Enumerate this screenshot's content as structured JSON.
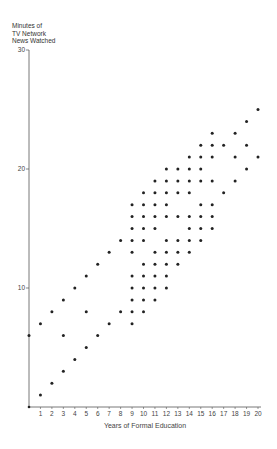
{
  "chart_data": {
    "type": "scatter",
    "title": "",
    "xlabel": "Years of Formal Education",
    "ylabel": "Minutes of TV Network News Watched",
    "ylabel_lines": [
      "Minutes of",
      "TV Network",
      "News Watched"
    ],
    "xlim": [
      0,
      20
    ],
    "ylim": [
      0,
      30
    ],
    "x_ticks": [
      1,
      2,
      3,
      4,
      5,
      6,
      7,
      8,
      9,
      10,
      11,
      12,
      13,
      14,
      15,
      16,
      17,
      18,
      19,
      20
    ],
    "y_ticks": [
      10,
      20,
      30
    ],
    "y_tick_labels": [
      "10",
      "20",
      "30"
    ],
    "grid": false,
    "legend": null,
    "points_by_x": {
      "0": [
        6
      ],
      "1": [
        7,
        1
      ],
      "2": [
        8,
        2
      ],
      "3": [
        9,
        6,
        3
      ],
      "4": [
        10,
        4
      ],
      "5": [
        11,
        8,
        5
      ],
      "6": [
        12,
        6
      ],
      "7": [
        13,
        7
      ],
      "8": [
        14,
        8
      ],
      "9": [
        17,
        16,
        15,
        14,
        13,
        11,
        10,
        9,
        8,
        7
      ],
      "10": [
        18,
        17,
        16,
        15,
        14,
        12,
        11,
        10,
        9,
        8
      ],
      "11": [
        19,
        18,
        17,
        16,
        15,
        13,
        12,
        11,
        10,
        9
      ],
      "12": [
        20,
        19,
        18,
        17,
        16,
        14,
        13,
        12,
        11,
        10
      ],
      "13": [
        20,
        19,
        18,
        16,
        14,
        13,
        12
      ],
      "14": [
        21,
        20,
        19,
        18,
        16,
        15,
        14,
        13
      ],
      "15": [
        22,
        21,
        20,
        19,
        17,
        16,
        15,
        14
      ],
      "16": [
        23,
        22,
        21,
        19,
        17,
        16,
        15
      ],
      "17": [
        22,
        18
      ],
      "18": [
        23,
        21,
        19
      ],
      "19": [
        24,
        22,
        20
      ],
      "20": [
        25,
        21
      ]
    },
    "colors": {
      "point": "#222222",
      "axis": "#555555"
    }
  }
}
